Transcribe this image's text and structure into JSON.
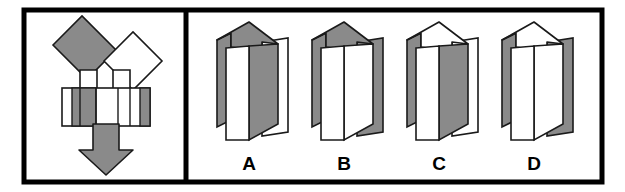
{
  "figure": {
    "type": "spatial-folding-test-item",
    "layout": "two-panel-bordered-figure",
    "panels": 2,
    "colors": {
      "border": "#000000",
      "background": "#ffffff",
      "shaded_face": "#8a8a8a",
      "unshaded_face": "#ffffff",
      "outline": "#1a1a1a"
    },
    "frame": {
      "outer_border_width_px": 5,
      "divider_x_px": 185
    }
  },
  "stimulus_panel": {
    "name": "unfolded-net-panel",
    "description": "Flat unfolded net with two rotated squares forming a V, a horizontal banded strip, and a downward arrow",
    "parts": [
      {
        "name": "left-rotated-square",
        "shape": "square-rotated-45",
        "fill": "#8a8a8a",
        "stroke": "#1a1a1a"
      },
      {
        "name": "right-rotated-square",
        "shape": "square-rotated-45",
        "fill": "#ffffff",
        "stroke": "#1a1a1a"
      },
      {
        "name": "left-connector-tab",
        "shape": "rectangle-tab",
        "fill": "#ffffff",
        "stroke": "#1a1a1a"
      },
      {
        "name": "right-connector-tab",
        "shape": "rectangle-tab",
        "fill": "#ffffff",
        "stroke": "#1a1a1a"
      },
      {
        "name": "horizontal-banded-strip",
        "shape": "rectangle-with-vertical-stripes",
        "stripe_pattern": [
          "white",
          "gray",
          "white",
          "white",
          "gray"
        ],
        "stroke": "#1a1a1a"
      },
      {
        "name": "down-arrow",
        "shape": "block-arrow-down",
        "fill": "#8a8a8a",
        "stroke": "#1a1a1a",
        "direction": "down"
      }
    ]
  },
  "answer_panel": {
    "name": "answer-options-panel",
    "option_count": 4,
    "options": [
      {
        "id": "A",
        "label": "A",
        "name": "option-a",
        "description": "Folded prism: top face shaded gray, right side panel white, front face white",
        "top_face": "gray",
        "right_panel": "white",
        "left_flap": "gray",
        "front_face": "white",
        "side_face": "gray"
      },
      {
        "id": "B",
        "label": "B",
        "name": "option-b",
        "description": "Folded prism: top face shaded gray, right side panel gray, front face white",
        "top_face": "gray",
        "right_panel": "gray",
        "left_flap": "gray",
        "front_face": "white",
        "side_face": "white"
      },
      {
        "id": "C",
        "label": "C",
        "name": "option-c",
        "description": "Folded prism: top face white, right side panel white, inner face gray",
        "top_face": "white",
        "right_panel": "white",
        "left_flap": "gray",
        "front_face": "white",
        "side_face": "gray"
      },
      {
        "id": "D",
        "label": "D",
        "name": "option-d",
        "description": "Folded prism: top face white, right side panel gray, front face white",
        "top_face": "white",
        "right_panel": "gray",
        "left_flap": "gray",
        "front_face": "white",
        "side_face": "white"
      }
    ]
  }
}
